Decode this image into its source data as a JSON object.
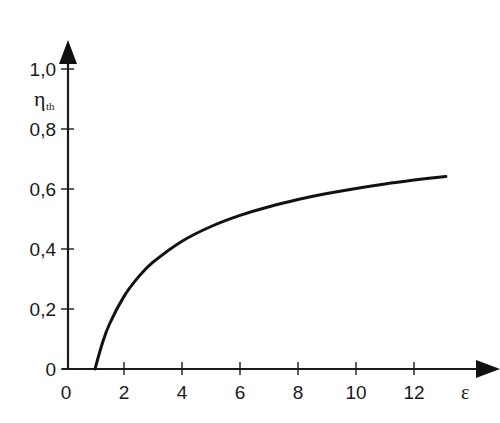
{
  "chart_data": {
    "type": "line",
    "title": "",
    "xlabel": "ε",
    "ylabel": "η",
    "ylabel_subscript": "th",
    "xlim": [
      0,
      14
    ],
    "ylim": [
      0,
      1.1
    ],
    "grid": false,
    "legend": null,
    "x_ticks": [
      {
        "value": 0,
        "label": "0"
      },
      {
        "value": 2,
        "label": "2"
      },
      {
        "value": 4,
        "label": "4"
      },
      {
        "value": 6,
        "label": "6"
      },
      {
        "value": 8,
        "label": "8"
      },
      {
        "value": 10,
        "label": "10"
      },
      {
        "value": 12,
        "label": "12"
      }
    ],
    "y_ticks": [
      {
        "value": 0,
        "label": "0"
      },
      {
        "value": 0.2,
        "label": "0,2"
      },
      {
        "value": 0.4,
        "label": "0,4"
      },
      {
        "value": 0.6,
        "label": "0,6"
      },
      {
        "value": 0.8,
        "label": "0,8"
      },
      {
        "value": 1.0,
        "label": "1,0"
      }
    ],
    "series": [
      {
        "name": "η_th",
        "x": [
          1,
          1.25,
          1.5,
          2,
          2.5,
          3,
          4,
          5,
          6,
          7,
          8,
          9,
          10,
          11,
          12,
          13.1
        ],
        "y": [
          0,
          0.085,
          0.15,
          0.242,
          0.307,
          0.356,
          0.426,
          0.475,
          0.512,
          0.541,
          0.565,
          0.585,
          0.602,
          0.617,
          0.63,
          0.642
        ]
      }
    ]
  }
}
